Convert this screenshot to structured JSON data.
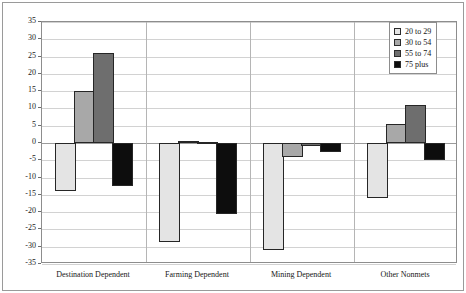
{
  "chart_data": {
    "type": "bar",
    "title": "",
    "subtitle": "",
    "xlabel": "",
    "ylabel": "",
    "ylim": [
      -35,
      35
    ],
    "ytick_step": 5,
    "yticks": [
      35,
      30,
      25,
      20,
      15,
      10,
      5,
      0,
      -5,
      -10,
      -15,
      -20,
      -25,
      -30,
      -35
    ],
    "ytick_labels": [
      "35",
      "30",
      "25",
      "20",
      "15",
      "10",
      "5",
      "0",
      "-5",
      "-10",
      "-15",
      "-20",
      "-25",
      "-30",
      "-35"
    ],
    "grid": true,
    "legend_position": "top-right",
    "categories": [
      "Destination Dependent",
      "Farming Dependent",
      "Mining Dependent",
      "Other Nonmets"
    ],
    "series": [
      {
        "name": "20 to 29",
        "color": "#e4e4e4",
        "values": [
          -14.0,
          -28.7,
          -31.0,
          -16.0
        ]
      },
      {
        "name": "30 to 54",
        "color": "#a8a8a8",
        "values": [
          15.0,
          0.5,
          -4.0,
          5.5
        ]
      },
      {
        "name": "55 to 74",
        "color": "#6e6e6e",
        "values": [
          26.0,
          0.4,
          -1.0,
          11.0
        ]
      },
      {
        "name": "75 plus",
        "color": "#0d0d0d",
        "values": [
          -12.5,
          -20.5,
          -2.5,
          -5.0
        ]
      }
    ]
  },
  "legend": {
    "entries": [
      {
        "label": "20 to 29",
        "color": "#e4e4e4"
      },
      {
        "label": "30 to 54",
        "color": "#a8a8a8"
      },
      {
        "label": "55 to 74",
        "color": "#6e6e6e"
      },
      {
        "label": "75 plus",
        "color": "#0d0d0d"
      }
    ]
  }
}
